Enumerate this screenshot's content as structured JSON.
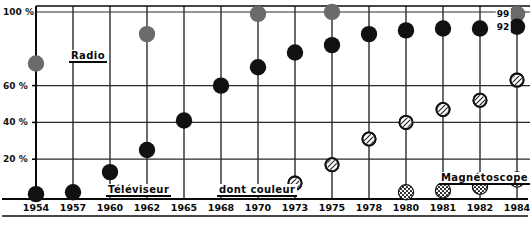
{
  "chart_data": {
    "type": "scatter",
    "title": "",
    "subtitle": "",
    "xlabel": "",
    "ylabel": "",
    "grid": true,
    "legend_position": "inline-annotations",
    "ylim": [
      0,
      100
    ],
    "xlim": [
      1954,
      1984
    ],
    "y_ticks": [
      {
        "value": 100,
        "label": "100 %"
      },
      {
        "value": 60,
        "label": "60 %"
      },
      {
        "value": 40,
        "label": "40 %"
      },
      {
        "value": 20,
        "label": "20 %"
      }
    ],
    "x": [
      1954,
      1957,
      1960,
      1962,
      1965,
      1968,
      1970,
      1973,
      1975,
      1978,
      1980,
      1981,
      1982,
      1984
    ],
    "x_tick_labels": [
      "1954",
      "1957",
      "1960",
      "1962",
      "1965",
      "1968",
      "1970",
      "1973",
      "1975",
      "1978",
      "1980",
      "1981",
      "1982",
      "1984"
    ],
    "series": [
      {
        "name": "Radio",
        "marker": "filled-gray-circle",
        "color": "#6b6b6b",
        "points": [
          {
            "x": 1954,
            "y": 72
          },
          {
            "x": 1962,
            "y": 88
          },
          {
            "x": 1970,
            "y": 99
          },
          {
            "x": 1975,
            "y": 100
          },
          {
            "x": 1984,
            "y": 99
          }
        ]
      },
      {
        "name": "Téléviseur",
        "marker": "filled-black-circle",
        "color": "#111111",
        "points": [
          {
            "x": 1954,
            "y": 1
          },
          {
            "x": 1957,
            "y": 2
          },
          {
            "x": 1960,
            "y": 13
          },
          {
            "x": 1962,
            "y": 25
          },
          {
            "x": 1965,
            "y": 41
          },
          {
            "x": 1968,
            "y": 60
          },
          {
            "x": 1970,
            "y": 70
          },
          {
            "x": 1973,
            "y": 78
          },
          {
            "x": 1975,
            "y": 82
          },
          {
            "x": 1978,
            "y": 88
          },
          {
            "x": 1980,
            "y": 90
          },
          {
            "x": 1981,
            "y": 91
          },
          {
            "x": 1982,
            "y": 91
          },
          {
            "x": 1984,
            "y": 92
          }
        ]
      },
      {
        "name": "dont couleur",
        "marker": "open-hatched-circle",
        "color": "#ffffff",
        "points": [
          {
            "x": 1973,
            "y": 7
          },
          {
            "x": 1975,
            "y": 17
          },
          {
            "x": 1978,
            "y": 31
          },
          {
            "x": 1980,
            "y": 40
          },
          {
            "x": 1981,
            "y": 47
          },
          {
            "x": 1982,
            "y": 52
          },
          {
            "x": 1984,
            "y": 63
          }
        ]
      },
      {
        "name": "Magnétoscope",
        "marker": "stippled-circle",
        "color": "#2b2b2b",
        "points": [
          {
            "x": 1980,
            "y": 2
          },
          {
            "x": 1981,
            "y": 3
          },
          {
            "x": 1982,
            "y": 5
          },
          {
            "x": 1984,
            "y": 9
          }
        ]
      }
    ],
    "annotations": [
      {
        "text": "99",
        "x": 1984,
        "y": 99,
        "series": "Radio"
      },
      {
        "text": "92",
        "x": 1984,
        "y": 92,
        "series": "Téléviseur"
      }
    ],
    "inline_labels": [
      {
        "text": "Radio",
        "x": 1957,
        "y": 76
      },
      {
        "text": "Téléviseur",
        "x": 1960,
        "y": 3
      },
      {
        "text": "dont couleur",
        "x": 1968,
        "y": 3
      },
      {
        "text": "Magnétoscope",
        "x": 1981,
        "y": 10
      }
    ]
  },
  "colors": {
    "background": "#f2f0ee",
    "plot_background": "#ffffff",
    "grid": "#2b2b2b",
    "axis": "#0a0a0a",
    "radio_marker": "#6b6b6b",
    "televiseur_marker": "#111111",
    "couleur_marker": "#ffffff",
    "magnetoscope_marker": "#2b2b2b"
  }
}
